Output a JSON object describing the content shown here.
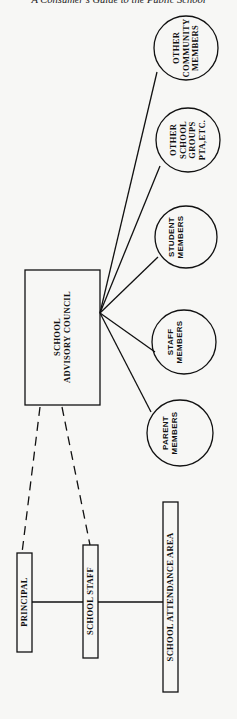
{
  "header": {
    "title": "A Consumer's Guide to the Public School"
  },
  "diagram": {
    "council": {
      "label": "SCHOOL\nADVISORY COUNCIL"
    },
    "members": [
      {
        "id": "other-community",
        "label": "OTHER\nCOMMUNITY\nMEMBERS"
      },
      {
        "id": "other-school-groups",
        "label": "OTHER\nSCHOOL\nGROUPS\nPTA,ETC."
      },
      {
        "id": "student",
        "label": "STUDENT\nMEMBERS"
      },
      {
        "id": "staff",
        "label": "STAFF\nMEMBERS"
      },
      {
        "id": "parent",
        "label": "PARENT\nMEMBERS"
      }
    ],
    "principal": {
      "label": "PRINCIPAL"
    },
    "school_staff": {
      "label": "SCHOOL STAFF"
    },
    "attendance_area": {
      "label": "SCHOOL ATTENDANCE AREA"
    }
  }
}
